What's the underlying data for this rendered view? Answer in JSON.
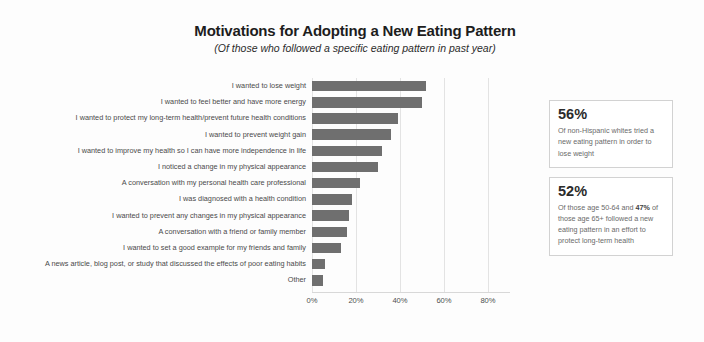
{
  "header": {
    "title": "Motivations for Adopting a New Eating Pattern",
    "subtitle": "(Of those who followed a specific eating pattern in past year)"
  },
  "chart_data": {
    "type": "bar",
    "orientation": "horizontal",
    "title": "Motivations for Adopting a New Eating Pattern",
    "subtitle": "(Of those who followed a specific eating pattern in past year)",
    "xlabel": "",
    "ylabel": "",
    "xlim": [
      0,
      90
    ],
    "grid": true,
    "legend": "none",
    "tick_labels": [
      "0%",
      "20%",
      "40%",
      "60%",
      "80%"
    ],
    "tick_values": [
      0,
      20,
      40,
      60,
      80
    ],
    "bar_color": "#6f6f6f",
    "categories": [
      "I wanted to lose weight",
      "I wanted to feel better and have more energy",
      "I wanted to protect my long-term health/prevent future health conditions",
      "I wanted to prevent weight gain",
      "I wanted to improve my health so I can have more independence in life",
      "I noticed a change in my physical appearance",
      "A conversation with my personal health care professional",
      "I was diagnosed with a health condition",
      "I wanted to prevent any changes in my physical appearance",
      "A conversation with a friend or family member",
      "I wanted to set a good example for my friends and family",
      "A news article, blog post, or study that discussed the effects of poor eating habits",
      "Other"
    ],
    "values": [
      52,
      50,
      39,
      36,
      32,
      30,
      22,
      18,
      17,
      16,
      13,
      6,
      5
    ]
  },
  "callouts": [
    {
      "stat": "56%",
      "text_parts": [
        {
          "text": "Of non-Hispanic whites tried a new eating pattern in order to lose weight",
          "bold": false
        }
      ]
    },
    {
      "stat": "52%",
      "text_parts": [
        {
          "text": "Of those age 50-64 and ",
          "bold": false
        },
        {
          "text": "47%",
          "bold": true
        },
        {
          "text": " of those age 65+ followed a new eating pattern in an effort to protect long-term health",
          "bold": false
        }
      ]
    }
  ]
}
